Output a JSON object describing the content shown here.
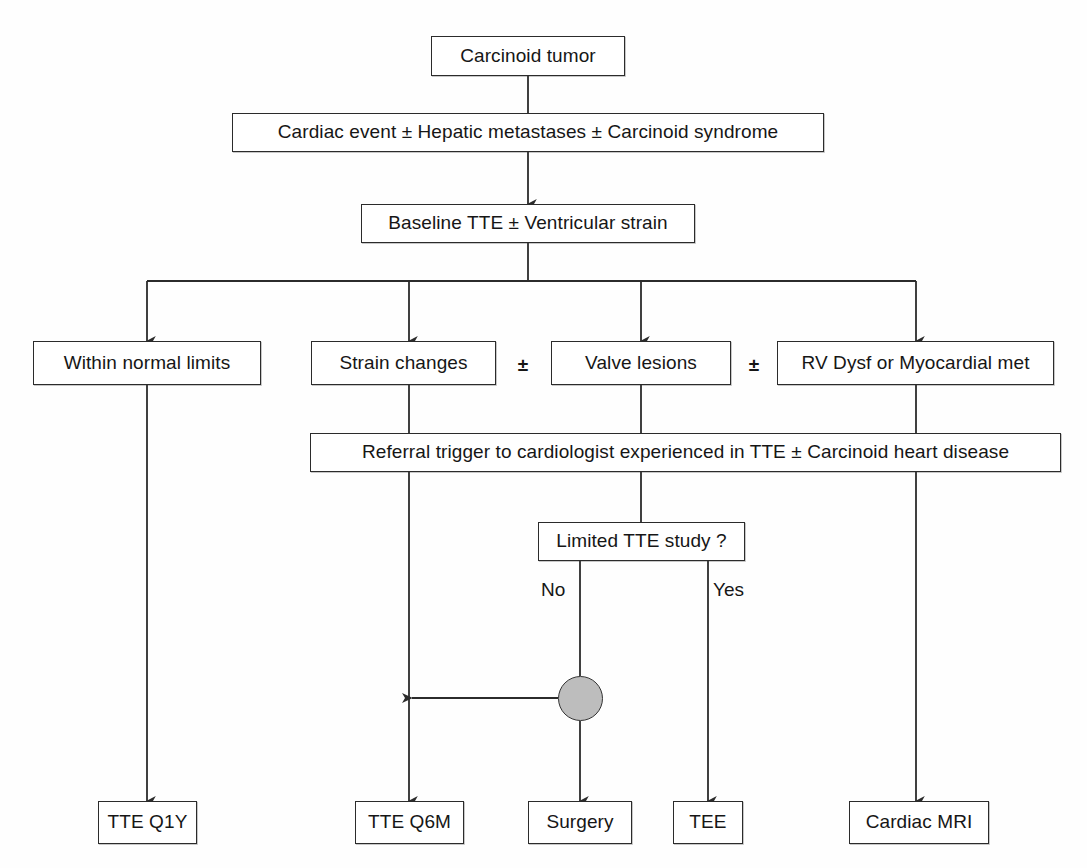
{
  "diagram": {
    "line_color": "#2b2b2b",
    "node_fill": "#ffffff",
    "junction_fill": "#bdbdbd",
    "nodes": {
      "carcinoid_tumor": "Carcinoid tumor",
      "cardiac_event": "Cardiac event ± Hepatic metastases ± Carcinoid syndrome",
      "baseline_tte": "Baseline TTE ± Ventricular strain",
      "within_normal_limits": "Within normal limits",
      "strain_changes": "Strain changes",
      "valve_lesions": "Valve lesions",
      "rv_dysf": "RV Dysf or Myocardial met",
      "referral_trigger": "Referral trigger to cardiologist experienced in TTE ± Carcinoid heart disease",
      "limited_tte_study": "Limited TTE study ?",
      "tte_q1y": "TTE Q1Y",
      "tte_q6m": "TTE Q6M",
      "surgery": "Surgery",
      "tee": "TEE",
      "cardiac_mri": "Cardiac MRI"
    },
    "connectors": {
      "plus_1": "±",
      "plus_2": "±",
      "label_no": "No",
      "label_yes": "Yes"
    }
  }
}
